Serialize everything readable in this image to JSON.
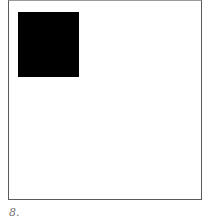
{
  "figure": {
    "caption": "8.",
    "frame_color": "#5a5a5a",
    "square_color": "#000000"
  }
}
